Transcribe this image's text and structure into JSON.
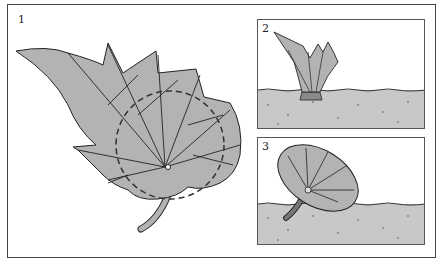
{
  "figure": {
    "panels": [
      {
        "number": "1",
        "description": "Leaf with dashed circle marking cut around the stem"
      },
      {
        "number": "2",
        "description": "Leaf folded upward into a cup, base in soil"
      },
      {
        "number": "3",
        "description": "Circular leaf disc with stem planted in soil"
      }
    ]
  },
  "colors": {
    "leaf_fill": "#b3b3b3",
    "soil_fill": "#c8c8c8",
    "outline": "#222222",
    "border": "#444444"
  }
}
